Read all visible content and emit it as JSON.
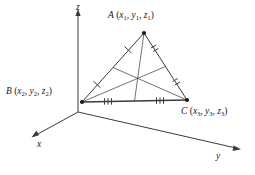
{
  "figure": {
    "background": "#ffffff",
    "stroke_color": "#333333",
    "width": 255,
    "height": 175
  },
  "axes": {
    "origin": [
      78,
      112
    ],
    "labels": {
      "x": "x",
      "y": "y",
      "z": "z"
    },
    "endpoints": {
      "x": [
        30,
        137
      ],
      "y": [
        241,
        150
      ],
      "z": [
        78,
        10
      ]
    }
  },
  "vertices": {
    "A": {
      "point_label": "A",
      "coords": [
        "x",
        "y",
        "z"
      ],
      "subscripts": [
        "1",
        "1",
        "1"
      ],
      "position": [
        144,
        33
      ],
      "full_label": "A (x1, y1, z1)"
    },
    "B": {
      "point_label": "B",
      "coords": [
        "x",
        "y",
        "z"
      ],
      "subscripts": [
        "2",
        "2",
        "2"
      ],
      "position": [
        82,
        102
      ],
      "full_label": "B (x2, y2, z2)"
    },
    "C": {
      "point_label": "C",
      "coords": [
        "x",
        "y",
        "z"
      ],
      "subscripts": [
        "3",
        "3",
        "3"
      ],
      "position": [
        187,
        100
      ],
      "full_label": "C (x3, y3, z3)"
    }
  },
  "centroid": {
    "position": [
      137,
      78
    ],
    "label": ""
  },
  "midpoints": {
    "AB": [
      113,
      67
    ],
    "AC": [
      165,
      66
    ],
    "BC": [
      134,
      101
    ]
  },
  "tick_marks": {
    "side_AB_count": 1,
    "side_AC_count": 2,
    "side_BC_count": 3
  }
}
